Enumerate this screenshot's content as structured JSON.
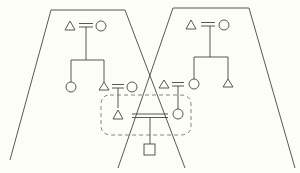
{
  "diagram": {
    "title": "Kinship diagram: two overlapping family groups linked by marriage",
    "colors": {
      "line": "#444444",
      "dashed": "#777777",
      "background": "#fdfdf8"
    },
    "groups": [
      {
        "id": "left-group",
        "label": "Left kin group",
        "shape": "trapezoid",
        "points": [
          [
            51,
            10
          ],
          [
            125,
            10
          ],
          [
            185,
            168
          ],
          [
            10,
            160
          ]
        ]
      },
      {
        "id": "right-group",
        "label": "Right kin group",
        "shape": "trapezoid",
        "points": [
          [
            173,
            8
          ],
          [
            249,
            8
          ],
          [
            295,
            168
          ],
          [
            118,
            168
          ]
        ]
      }
    ],
    "legend": {
      "triangle": "male",
      "circle": "female",
      "square": "child (sex unspecified)",
      "double-line": "marriage",
      "dashed-box": "inter-group marriage"
    },
    "nodes": [
      {
        "id": "L-father",
        "symbol": "triangle",
        "x": 70,
        "y": 25
      },
      {
        "id": "L-mother",
        "symbol": "circle",
        "x": 102,
        "y": 25
      },
      {
        "id": "L-daughter",
        "symbol": "circle",
        "x": 70,
        "y": 87
      },
      {
        "id": "L-son",
        "symbol": "triangle",
        "x": 105,
        "y": 87
      },
      {
        "id": "L-son-wife",
        "symbol": "circle",
        "x": 133,
        "y": 87
      },
      {
        "id": "R-father",
        "symbol": "triangle",
        "x": 191,
        "y": 25
      },
      {
        "id": "R-mother",
        "symbol": "circle",
        "x": 224,
        "y": 25
      },
      {
        "id": "R-daughter",
        "symbol": "circle",
        "x": 193,
        "y": 84
      },
      {
        "id": "R-son",
        "symbol": "triangle",
        "x": 228,
        "y": 84
      },
      {
        "id": "R-daughter-husband",
        "symbol": "triangle",
        "x": 164,
        "y": 84
      },
      {
        "id": "cross-male",
        "symbol": "triangle",
        "x": 118,
        "y": 115
      },
      {
        "id": "cross-female",
        "symbol": "circle",
        "x": 178,
        "y": 114
      },
      {
        "id": "child",
        "symbol": "square",
        "x": 148,
        "y": 152
      }
    ],
    "caption": "Overlapping kin groups diagram"
  }
}
